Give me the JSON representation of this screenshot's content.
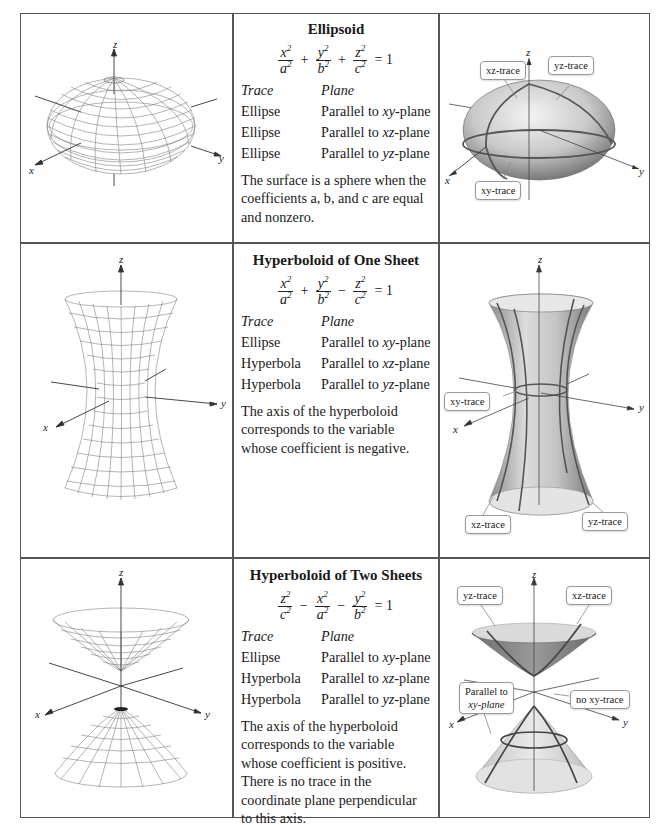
{
  "rows": [
    {
      "title": "Ellipsoid",
      "equation": {
        "terms": [
          {
            "sign": "",
            "num": "x",
            "den": "a"
          },
          {
            "sign": "+",
            "num": "y",
            "den": "b"
          },
          {
            "sign": "+",
            "num": "z",
            "den": "c"
          }
        ],
        "rhs": "= 1",
        "exp": "2"
      },
      "header": {
        "trace": "Trace",
        "plane": "Plane"
      },
      "traces": [
        {
          "trace": "Ellipse",
          "plane_prefix": "Parallel to ",
          "plane_var": "xy",
          "plane_suffix": "-plane"
        },
        {
          "trace": "Ellipse",
          "plane_prefix": "Parallel to ",
          "plane_var": "xz",
          "plane_suffix": "-plane"
        },
        {
          "trace": "Ellipse",
          "plane_prefix": "Parallel to ",
          "plane_var": "yz",
          "plane_suffix": "-plane"
        }
      ],
      "description": "The surface is a sphere when the coefficients a, b, and c are equal and nonzero.",
      "wire_fig": {
        "axes": {
          "x": "x",
          "y": "y",
          "z": "z"
        }
      },
      "shaded_fig": {
        "axes": {
          "x": "x",
          "y": "y",
          "z": "z"
        },
        "callouts": [
          "xz-trace",
          "yz-trace",
          "xy-trace"
        ]
      }
    },
    {
      "title": "Hyperboloid of One Sheet",
      "equation": {
        "terms": [
          {
            "sign": "",
            "num": "x",
            "den": "a"
          },
          {
            "sign": "+",
            "num": "y",
            "den": "b"
          },
          {
            "sign": "−",
            "num": "z",
            "den": "c"
          }
        ],
        "rhs": "= 1",
        "exp": "2"
      },
      "header": {
        "trace": "Trace",
        "plane": "Plane"
      },
      "traces": [
        {
          "trace": "Ellipse",
          "plane_prefix": "Parallel to ",
          "plane_var": "xy",
          "plane_suffix": "-plane"
        },
        {
          "trace": "Hyperbola",
          "plane_prefix": "Parallel to ",
          "plane_var": "xz",
          "plane_suffix": "-plane"
        },
        {
          "trace": "Hyperbola",
          "plane_prefix": "Parallel to ",
          "plane_var": "yz",
          "plane_suffix": "-plane"
        }
      ],
      "description": "The axis of the hyperboloid corresponds to the variable whose coefficient is negative.",
      "wire_fig": {
        "axes": {
          "x": "x",
          "y": "y",
          "z": "z"
        }
      },
      "shaded_fig": {
        "axes": {
          "x": "x",
          "y": "y",
          "z": "z"
        },
        "callouts": [
          "xy-trace",
          "xz-trace",
          "yz-trace"
        ]
      }
    },
    {
      "title": "Hyperboloid of Two Sheets",
      "equation": {
        "terms": [
          {
            "sign": "",
            "num": "z",
            "den": "c"
          },
          {
            "sign": "−",
            "num": "x",
            "den": "a"
          },
          {
            "sign": "−",
            "num": "y",
            "den": "b"
          }
        ],
        "rhs": "= 1",
        "exp": "2"
      },
      "header": {
        "trace": "Trace",
        "plane": "Plane"
      },
      "traces": [
        {
          "trace": "Ellipse",
          "plane_prefix": "Parallel to ",
          "plane_var": "xy",
          "plane_suffix": "-plane"
        },
        {
          "trace": "Hyperbola",
          "plane_prefix": "Parallel to ",
          "plane_var": "xz",
          "plane_suffix": "-plane"
        },
        {
          "trace": "Hyperbola",
          "plane_prefix": "Parallel to ",
          "plane_var": "yz",
          "plane_suffix": "-plane"
        }
      ],
      "description": "The axis of the hyperboloid corresponds to the variable whose coefficient is positive. There is no trace in the coordinate plane perpendicular to this axis.",
      "wire_fig": {
        "axes": {
          "x": "x",
          "y": "y",
          "z": "z"
        }
      },
      "shaded_fig": {
        "axes": {
          "x": "x",
          "y": "y",
          "z": "z"
        },
        "callouts": [
          "yz-trace",
          "xz-trace",
          "Parallel to",
          "xy-plane",
          "no xy-trace"
        ]
      }
    }
  ]
}
